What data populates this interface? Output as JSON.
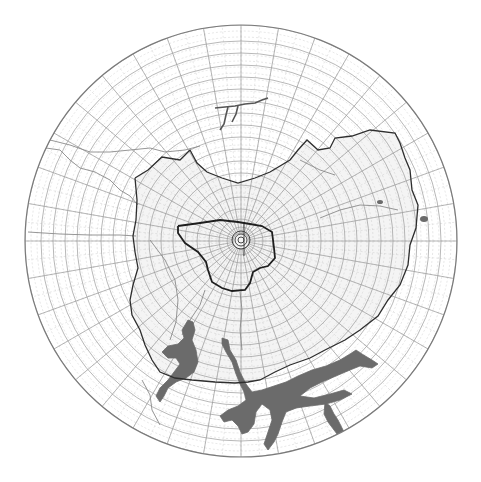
{
  "map": {
    "projection": "polar azimuthal",
    "width": 481,
    "height": 482,
    "center": [
      241,
      241
    ],
    "radius": 216,
    "colors": {
      "background": "#ffffff",
      "outer_ring": "#7a7a7a",
      "grid_major": "#9a9a9a",
      "grid_minor": "#cfcfcf",
      "boundary_outer": "#2e2e2e",
      "boundary_inner": "#1e1e1e",
      "rivers": "#8a8a8a",
      "water_body": "#6b6b6b",
      "shaded_zone": "#ececec"
    },
    "grid": {
      "ring_radii": [
        8,
        14,
        22,
        32,
        44,
        56,
        68,
        80,
        92,
        104,
        116,
        128,
        140,
        152,
        164,
        176,
        188,
        200,
        216
      ],
      "minor_ring_step": 6,
      "radial_count": 36,
      "minor_radial_count": 72
    },
    "outer_boundary": [
      [
        135,
        178
      ],
      [
        148,
        170
      ],
      [
        162,
        157
      ],
      [
        180,
        160
      ],
      [
        190,
        150
      ],
      [
        197,
        163
      ],
      [
        207,
        172
      ],
      [
        222,
        178
      ],
      [
        238,
        183
      ],
      [
        255,
        178
      ],
      [
        270,
        172
      ],
      [
        290,
        160
      ],
      [
        298,
        150
      ],
      [
        307,
        140
      ],
      [
        318,
        150
      ],
      [
        330,
        148
      ],
      [
        335,
        138
      ],
      [
        352,
        136
      ],
      [
        370,
        130
      ],
      [
        395,
        133
      ],
      [
        400,
        143
      ],
      [
        405,
        158
      ],
      [
        410,
        170
      ],
      [
        412,
        190
      ],
      [
        418,
        205
      ],
      [
        416,
        228
      ],
      [
        410,
        245
      ],
      [
        408,
        265
      ],
      [
        400,
        285
      ],
      [
        388,
        300
      ],
      [
        378,
        316
      ],
      [
        360,
        330
      ],
      [
        345,
        340
      ],
      [
        325,
        350
      ],
      [
        310,
        358
      ],
      [
        290,
        365
      ],
      [
        275,
        372
      ],
      [
        260,
        380
      ],
      [
        248,
        382
      ],
      [
        235,
        383
      ],
      [
        215,
        382
      ],
      [
        192,
        380
      ],
      [
        175,
        378
      ],
      [
        160,
        372
      ],
      [
        152,
        360
      ],
      [
        145,
        345
      ],
      [
        140,
        330
      ],
      [
        132,
        315
      ],
      [
        130,
        300
      ],
      [
        133,
        285
      ],
      [
        138,
        268
      ],
      [
        135,
        252
      ],
      [
        133,
        236
      ],
      [
        136,
        220
      ],
      [
        137,
        200
      ],
      [
        135,
        178
      ]
    ],
    "inner_boundary": [
      [
        178,
        226
      ],
      [
        200,
        223
      ],
      [
        220,
        220
      ],
      [
        238,
        222
      ],
      [
        250,
        224
      ],
      [
        262,
        226
      ],
      [
        272,
        232
      ],
      [
        274,
        248
      ],
      [
        275,
        258
      ],
      [
        268,
        266
      ],
      [
        260,
        268
      ],
      [
        253,
        272
      ],
      [
        250,
        283
      ],
      [
        245,
        290
      ],
      [
        232,
        291
      ],
      [
        222,
        288
      ],
      [
        212,
        282
      ],
      [
        208,
        270
      ],
      [
        206,
        262
      ],
      [
        198,
        252
      ],
      [
        185,
        243
      ],
      [
        178,
        233
      ],
      [
        178,
        226
      ]
    ],
    "center_spiral": {
      "cx": 241,
      "cy": 240,
      "radii": [
        3,
        6,
        9
      ]
    },
    "rivers": [
      [
        [
          46,
          148
        ],
        [
          60,
          150
        ],
        [
          70,
          160
        ],
        [
          80,
          168
        ],
        [
          95,
          172
        ],
        [
          110,
          180
        ],
        [
          120,
          190
        ],
        [
          130,
          196
        ],
        [
          138,
          205
        ]
      ],
      [
        [
          50,
          140
        ],
        [
          70,
          145
        ],
        [
          90,
          152
        ],
        [
          110,
          152
        ],
        [
          130,
          150
        ],
        [
          150,
          148
        ],
        [
          165,
          152
        ],
        [
          185,
          150
        ],
        [
          200,
          146
        ]
      ],
      [
        [
          28,
          232
        ],
        [
          60,
          234
        ],
        [
          90,
          235
        ],
        [
          120,
          235
        ],
        [
          136,
          236
        ]
      ],
      [
        [
          150,
          240
        ],
        [
          165,
          260
        ],
        [
          175,
          280
        ],
        [
          178,
          300
        ],
        [
          176,
          322
        ],
        [
          170,
          340
        ]
      ],
      [
        [
          205,
          290
        ],
        [
          200,
          305
        ],
        [
          190,
          320
        ],
        [
          182,
          335
        ]
      ],
      [
        [
          240,
          292
        ],
        [
          242,
          310
        ],
        [
          240,
          330
        ],
        [
          242,
          350
        ]
      ],
      [
        [
          320,
          218
        ],
        [
          340,
          210
        ],
        [
          360,
          205
        ],
        [
          380,
          206
        ],
        [
          398,
          210
        ]
      ],
      [
        [
          300,
          160
        ],
        [
          320,
          170
        ],
        [
          335,
          175
        ]
      ],
      [
        [
          142,
          380
        ],
        [
          150,
          395
        ],
        [
          152,
          410
        ],
        [
          160,
          425
        ]
      ]
    ],
    "upper_river": [
      [
        [
          215,
          108
        ],
        [
          225,
          107
        ],
        [
          235,
          106
        ],
        [
          245,
          104
        ],
        [
          255,
          103
        ],
        [
          262,
          100
        ],
        [
          268,
          98
        ]
      ],
      [
        [
          228,
          107
        ],
        [
          226,
          115
        ],
        [
          224,
          124
        ],
        [
          220,
          130
        ]
      ],
      [
        [
          238,
          106
        ],
        [
          236,
          114
        ],
        [
          232,
          122
        ]
      ]
    ],
    "east_spots": [
      [
        380,
        202,
        3,
        2
      ],
      [
        424,
        219,
        4,
        3
      ]
    ],
    "water_bodies": [
      "M 188 320 L 193 322 L 195 330 L 192 340 L 196 350 L 198 362 L 194 372 L 186 378 L 176 382 L 168 388 L 164 396 L 160 402 L 156 396 L 160 388 L 168 380 L 174 372 L 180 364 L 176 358 L 168 358 L 162 352 L 168 346 L 178 344 L 184 338 L 182 330 Z",
      "M 222 338 L 228 340 L 230 350 L 236 360 L 240 372 L 246 384 L 252 392 L 262 390 L 274 386 L 286 382 L 298 376 L 312 370 L 326 366 L 340 360 L 350 354 L 356 350 L 362 354 L 372 360 L 378 364 L 372 368 L 360 366 L 350 370 L 336 376 L 322 382 L 310 388 L 300 396 L 314 398 L 330 394 L 344 390 L 352 394 L 340 400 L 326 404 L 310 406 L 296 408 L 286 412 L 282 422 L 278 434 L 274 442 L 268 450 L 264 444 L 268 432 L 272 420 L 270 410 L 262 404 L 256 412 L 254 424 L 248 432 L 242 434 L 238 426 L 232 420 L 224 422 L 220 416 L 228 410 L 238 406 L 246 400 L 244 392 L 240 384 L 236 374 L 232 362 L 226 352 L 222 344 Z",
      "M 325 402 L 330 406 L 334 414 L 338 420 L 342 428 L 346 436 L 340 438 L 334 430 L 328 422 L 324 414 Z"
    ],
    "annotations": []
  }
}
